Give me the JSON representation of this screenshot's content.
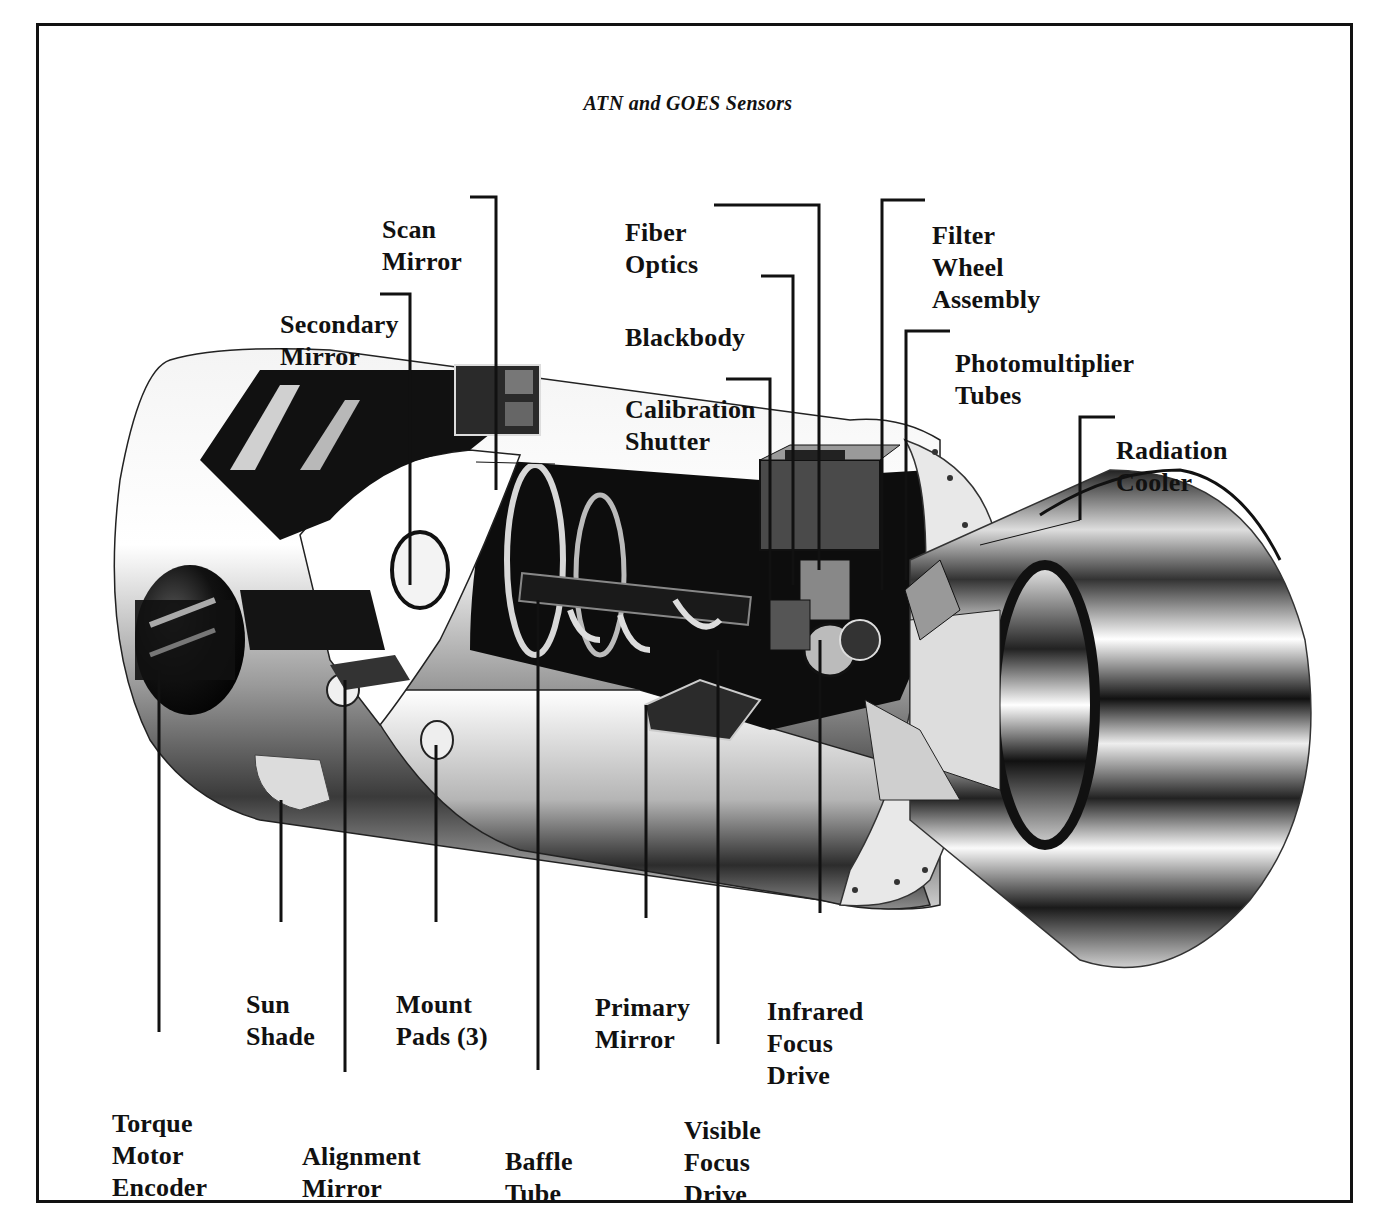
{
  "figure": {
    "title": "ATN and GOES Sensors",
    "colors": {
      "ink": "#111111",
      "paper": "#ffffff",
      "metal_dark": "#1a1a1a",
      "metal_mid": "#8a8a8a",
      "metal_light": "#e6e6e6"
    }
  },
  "labels": {
    "scan_mirror": [
      "Scan",
      "Mirror"
    ],
    "secondary_mirror": [
      "Secondary",
      "Mirror"
    ],
    "fiber_optics": [
      "Fiber",
      "Optics"
    ],
    "blackbody": [
      "Blackbody"
    ],
    "calibration_shutter": [
      "Calibration",
      "Shutter"
    ],
    "filter_wheel_assembly": [
      "Filter",
      "Wheel",
      "Assembly"
    ],
    "photomultiplier_tubes": [
      "Photomultiplier",
      "Tubes"
    ],
    "radiation_cooler": [
      "Radiation",
      "Cooler"
    ],
    "torque_motor_encoder": [
      "Torque",
      "Motor",
      "Encoder"
    ],
    "sun_shade": [
      "Sun",
      "Shade"
    ],
    "alignment_mirror": [
      "Alignment",
      "Mirror"
    ],
    "mount_pads": [
      "Mount",
      "Pads (3)"
    ],
    "baffle_tube": [
      "Baffle",
      "Tube"
    ],
    "primary_mirror": [
      "Primary",
      "Mirror"
    ],
    "visible_focus_drive": [
      "Visible",
      "Focus",
      "Drive"
    ],
    "infrared_focus_drive": [
      "Infrared",
      "Focus",
      "Drive"
    ]
  }
}
